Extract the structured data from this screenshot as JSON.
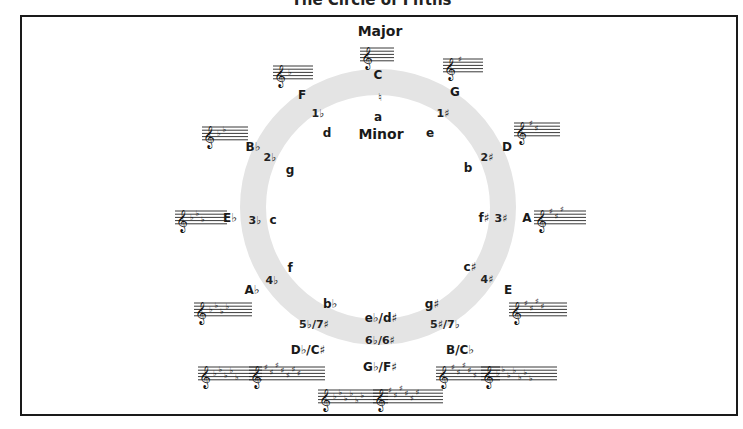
{
  "title": "The Circle of Fifths",
  "center_labels": {
    "major": "Major",
    "minor": "Minor"
  },
  "colors": {
    "ring": "#e4e4e4",
    "frame": "#1a1a1a",
    "text": "#1a1a1a"
  },
  "ring": {
    "cx": 378,
    "cy": 207,
    "r_outer": 138,
    "r_inner": 112
  },
  "major_keys": [
    {
      "label": "C",
      "x": 378,
      "y": 75
    },
    {
      "label": "G",
      "x": 455,
      "y": 92
    },
    {
      "label": "D",
      "x": 507,
      "y": 147
    },
    {
      "label": "A",
      "x": 527,
      "y": 218
    },
    {
      "label": "E",
      "x": 508,
      "y": 290
    },
    {
      "label": "B/C♭",
      "x": 460,
      "y": 350
    },
    {
      "label": "G♭/F♯",
      "x": 380,
      "y": 367
    },
    {
      "label": "D♭/C♯",
      "x": 308,
      "y": 350
    },
    {
      "label": "A♭",
      "x": 252,
      "y": 290
    },
    {
      "label": "E♭",
      "x": 230,
      "y": 218
    },
    {
      "label": "B♭",
      "x": 253,
      "y": 147
    },
    {
      "label": "F",
      "x": 302,
      "y": 95
    }
  ],
  "minor_keys": [
    {
      "label": "a",
      "x": 378,
      "y": 117
    },
    {
      "label": "e",
      "x": 430,
      "y": 133
    },
    {
      "label": "b",
      "x": 468,
      "y": 168
    },
    {
      "label": "f♯",
      "x": 484,
      "y": 218
    },
    {
      "label": "c♯",
      "x": 470,
      "y": 267
    },
    {
      "label": "g♯",
      "x": 432,
      "y": 304
    },
    {
      "label": "e♭/d♯",
      "x": 381,
      "y": 318
    },
    {
      "label": "b♭",
      "x": 330,
      "y": 304
    },
    {
      "label": "f",
      "x": 290,
      "y": 268
    },
    {
      "label": "c",
      "x": 273,
      "y": 220
    },
    {
      "label": "g",
      "x": 290,
      "y": 170
    },
    {
      "label": "d",
      "x": 327,
      "y": 133
    }
  ],
  "accidental_counts": [
    {
      "label": "♮",
      "x": 380,
      "y": 97
    },
    {
      "label": "1♯",
      "x": 443,
      "y": 113
    },
    {
      "label": "2♯",
      "x": 487,
      "y": 157
    },
    {
      "label": "3♯",
      "x": 501,
      "y": 218
    },
    {
      "label": "4♯",
      "x": 487,
      "y": 279
    },
    {
      "label": "5♯/7♭",
      "x": 445,
      "y": 324
    },
    {
      "label": "6♭/6♯",
      "x": 380,
      "y": 340
    },
    {
      "label": "5♭/7♯",
      "x": 314,
      "y": 324
    },
    {
      "label": "4♭",
      "x": 272,
      "y": 280
    },
    {
      "label": "3♭",
      "x": 255,
      "y": 220
    },
    {
      "label": "2♭",
      "x": 270,
      "y": 157
    },
    {
      "label": "1♭",
      "x": 318,
      "y": 113
    }
  ],
  "staves": [
    {
      "key": "C",
      "x": 377,
      "y": 55,
      "accidental": "",
      "count": 0
    },
    {
      "key": "G",
      "x": 463,
      "y": 66,
      "accidental": "♯",
      "count": 1
    },
    {
      "key": "D",
      "x": 537,
      "y": 130,
      "accidental": "♯",
      "count": 2
    },
    {
      "key": "A",
      "x": 560,
      "y": 218,
      "accidental": "♯",
      "count": 3
    },
    {
      "key": "E",
      "x": 538,
      "y": 310,
      "accidental": "♯",
      "count": 4
    },
    {
      "key": "B",
      "x": 468,
      "y": 374,
      "accidental": "♯",
      "count": 5
    },
    {
      "key": "Cb",
      "x": 519,
      "y": 374,
      "accidental": "♭",
      "count": 7
    },
    {
      "key": "F#",
      "x": 408,
      "y": 397,
      "accidental": "♯",
      "count": 6
    },
    {
      "key": "Gb",
      "x": 353,
      "y": 397,
      "accidental": "♭",
      "count": 6
    },
    {
      "key": "C#",
      "x": 287,
      "y": 374,
      "accidental": "♯",
      "count": 7
    },
    {
      "key": "Db",
      "x": 230,
      "y": 374,
      "accidental": "♭",
      "count": 5
    },
    {
      "key": "Ab",
      "x": 223,
      "y": 310,
      "accidental": "♭",
      "count": 4
    },
    {
      "key": "Eb",
      "x": 201,
      "y": 218,
      "accidental": "♭",
      "count": 3
    },
    {
      "key": "Bb",
      "x": 225,
      "y": 134,
      "accidental": "♭",
      "count": 2
    },
    {
      "key": "F",
      "x": 293,
      "y": 73,
      "accidental": "♭",
      "count": 1
    }
  ]
}
